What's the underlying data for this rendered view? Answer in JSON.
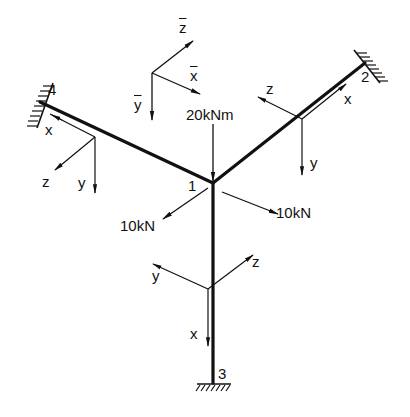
{
  "diagram": {
    "type": "space frame / grid structure with three members and clamped supports",
    "colors": {
      "ink": "#111111",
      "background": "#ffffff"
    },
    "global_axes": {
      "labels": {
        "x": "x",
        "y": "y",
        "z": "z"
      },
      "overbar": true
    },
    "nodes": [
      {
        "id": "1",
        "label": "1",
        "role": "free joint"
      },
      {
        "id": "2",
        "label": "2",
        "role": "clamped support"
      },
      {
        "id": "3",
        "label": "3",
        "role": "clamped support"
      },
      {
        "id": "4",
        "label": "4",
        "role": "clamped support"
      }
    ],
    "members": [
      {
        "from": "1",
        "to": "2",
        "local_axes": {
          "x": "x",
          "y": "y",
          "z": "z"
        }
      },
      {
        "from": "1",
        "to": "4",
        "local_axes": {
          "x": "x",
          "y": "y",
          "z": "z"
        }
      },
      {
        "from": "1",
        "to": "3",
        "local_axes": {
          "x": "x",
          "y": "y",
          "z": "z"
        }
      }
    ],
    "loads": [
      {
        "id": "moment",
        "label": "20kNm",
        "direction": "down (along global y-bar)"
      },
      {
        "id": "force-left",
        "label": "10kN",
        "direction": "toward lower-left (global z-bar)"
      },
      {
        "id": "force-right",
        "label": "10kN",
        "direction": "toward lower-right (global x-bar)"
      }
    ]
  }
}
